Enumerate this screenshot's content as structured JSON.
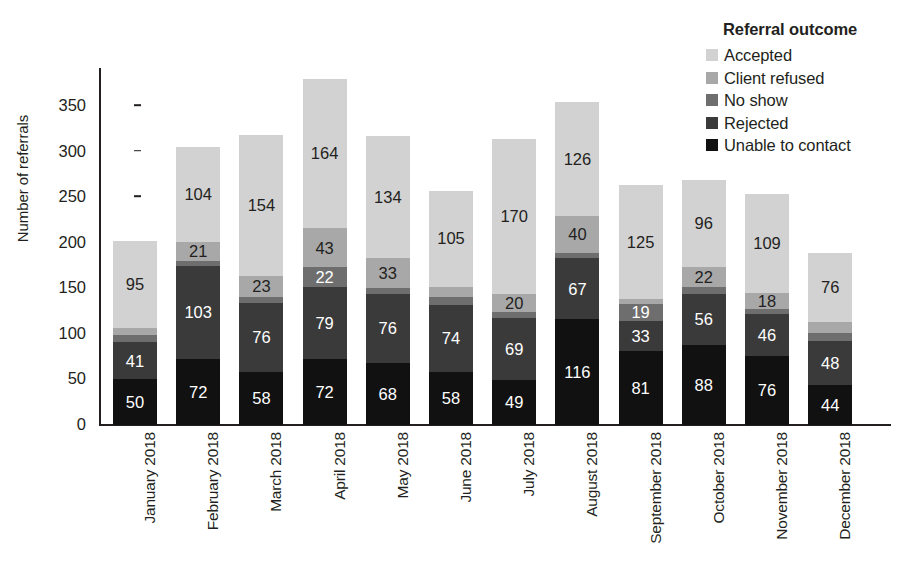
{
  "chart_data": {
    "type": "bar",
    "subtype": "stacked-vertical",
    "title": "",
    "xlabel": "",
    "ylabel": "Number of referrals",
    "ylim": [
      0,
      385
    ],
    "yticks": [
      0,
      50,
      100,
      150,
      200,
      250,
      300,
      350
    ],
    "grid": false,
    "legend_position": "top-right",
    "legend_title": "Referral outcome",
    "categories": [
      "January 2018",
      "February 2018",
      "March 2018",
      "April 2018",
      "May 2018",
      "June 2018",
      "July 2018",
      "August 2018",
      "September 2018",
      "October 2018",
      "November 2018",
      "December 2018"
    ],
    "series": [
      {
        "name": "Unable to contact",
        "color": "#111111",
        "label_color": "#ffffff",
        "values": [
          50,
          72,
          58,
          72,
          68,
          58,
          49,
          116,
          81,
          88,
          76,
          44
        ],
        "labels": [
          "50",
          "72",
          "58",
          "72",
          "68",
          "58",
          "49",
          "116",
          "81",
          "88",
          "76",
          "44"
        ]
      },
      {
        "name": "Rejected",
        "color": "#3a3a3a",
        "label_color": "#ffffff",
        "values": [
          41,
          103,
          76,
          79,
          76,
          74,
          69,
          67,
          33,
          56,
          46,
          48
        ],
        "labels": [
          "41",
          "103",
          "76",
          "79",
          "76",
          "74",
          "69",
          "67",
          "33",
          "56",
          "46",
          "48"
        ]
      },
      {
        "name": "No show",
        "color": "#6e6e6e",
        "label_color": "#ffffff",
        "values": [
          8,
          5,
          7,
          22,
          6,
          8,
          6,
          6,
          19,
          7,
          5,
          9
        ],
        "labels": [
          "",
          "",
          "",
          "22",
          "",
          "",
          "",
          "",
          "19",
          "",
          "",
          ""
        ]
      },
      {
        "name": "Client refused",
        "color": "#a8a8a8",
        "label_color": "#231f20",
        "values": [
          8,
          21,
          23,
          43,
          33,
          12,
          20,
          40,
          5,
          22,
          18,
          12
        ],
        "labels": [
          "",
          "21",
          "23",
          "43",
          "33",
          "",
          "20",
          "40",
          "",
          "22",
          "18",
          ""
        ]
      },
      {
        "name": "Accepted",
        "color": "#d2d2d2",
        "label_color": "#231f20",
        "values": [
          95,
          104,
          154,
          164,
          134,
          105,
          170,
          126,
          125,
          96,
          109,
          76
        ],
        "labels": [
          "95",
          "104",
          "154",
          "164",
          "134",
          "105",
          "170",
          "126",
          "125",
          "96",
          "109",
          "76"
        ]
      }
    ],
    "totals": [
      202,
      305,
      318,
      380,
      317,
      257,
      314,
      355,
      263,
      269,
      254,
      189
    ]
  },
  "legend": {
    "title": "Referral outcome",
    "items": [
      {
        "label": "Accepted",
        "color": "#d2d2d2"
      },
      {
        "label": "Client refused",
        "color": "#a8a8a8"
      },
      {
        "label": "No show",
        "color": "#6e6e6e"
      },
      {
        "label": "Rejected",
        "color": "#3a3a3a"
      },
      {
        "label": "Unable to contact",
        "color": "#111111"
      }
    ]
  },
  "axes": {
    "y_title": "Number of referrals",
    "y_ticks": [
      "0",
      "50",
      "100",
      "150",
      "200",
      "250",
      "300",
      "350"
    ]
  }
}
